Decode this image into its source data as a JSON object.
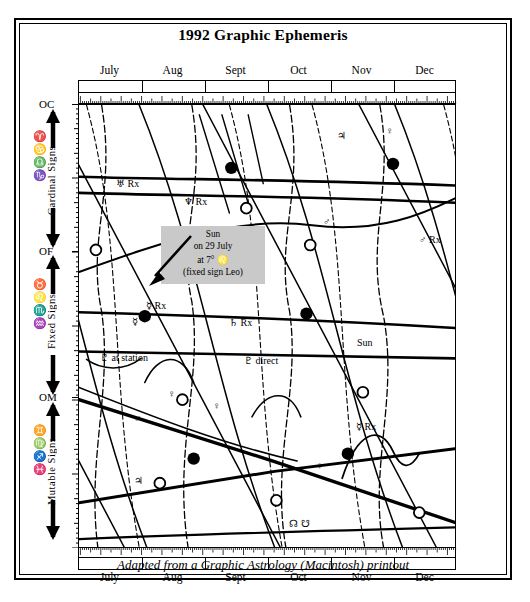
{
  "title": "1992 Graphic Ephemeris",
  "caption": "Adapted from a Graphic Astrology (Macintosh) printout",
  "axes": {
    "months": [
      "July",
      "Aug",
      "Sept",
      "Oct",
      "Nov",
      "Dec"
    ],
    "y_markers": [
      {
        "label": "OC",
        "meaning": "0 degrees Cardinal"
      },
      {
        "label": "OF",
        "meaning": "0 degrees Fixed"
      },
      {
        "label": "OM",
        "meaning": "0 degrees Mutable"
      }
    ],
    "y_groups": [
      {
        "name": "Cardinal Signs",
        "glyphs": "♈ ♋ ♎ ♑"
      },
      {
        "name": "Fixed Signs",
        "glyphs": "♉ ♌ ♏ ♒"
      },
      {
        "name": "Mutable Signs",
        "glyphs": "♊ ♍ ♐ ♓"
      }
    ]
  },
  "annotation": {
    "line1": "Sun",
    "line2": "on 29 July",
    "line3": "at 7° ♌",
    "line4": "(fixed sign Leo)"
  },
  "plot_labels": [
    {
      "id": "uranus-rx",
      "text": "♅ Rx"
    },
    {
      "id": "neptune-rx",
      "text": "♆ Rx"
    },
    {
      "id": "jupiter-top",
      "text": "♃"
    },
    {
      "id": "venus-top",
      "text": "♀"
    },
    {
      "id": "mars-mid",
      "text": "♂"
    },
    {
      "id": "mars-rx",
      "text": "♂ Rx"
    },
    {
      "id": "mercury-rx-1",
      "text": "☿ Rx"
    },
    {
      "id": "mercury-low-1",
      "text": "☿"
    },
    {
      "id": "saturn-rx",
      "text": "♄ Rx"
    },
    {
      "id": "pluto-station",
      "text": "♇ at station"
    },
    {
      "id": "pluto-direct",
      "text": "♇ direct"
    },
    {
      "id": "sun-open",
      "text": "Sun"
    },
    {
      "id": "mars-low",
      "text": "♂"
    },
    {
      "id": "venus-low",
      "text": "♀"
    },
    {
      "id": "venus-low-2",
      "text": "♀"
    },
    {
      "id": "mercury-rx-2",
      "text": "☿ Rx"
    },
    {
      "id": "jupiter-bottom",
      "text": "♃"
    },
    {
      "id": "lunar-nodes",
      "text": "☊ ☋"
    },
    {
      "id": "venus-right",
      "text": "♀"
    }
  ],
  "chart_data": {
    "type": "line",
    "title": "1992 Graphic Ephemeris",
    "xlabel": "",
    "ylabel": "",
    "x": [
      "July",
      "Aug",
      "Sept",
      "Oct",
      "Nov",
      "Dec"
    ],
    "xlim": [
      0,
      6
    ],
    "ylim": [
      0,
      90
    ],
    "grid": false,
    "legend": "inline-labels",
    "y_axis_note": "Degrees within mode; 0C at top, 0F at middle, 0M at lower; 3 x 30-degree bands",
    "series": [
      {
        "name": "Uranus Rx",
        "glyph": "♅",
        "values": [
          17,
          17.5,
          18,
          18.5,
          19,
          19.5
        ]
      },
      {
        "name": "Neptune Rx",
        "glyph": "♆",
        "values": [
          21,
          21.3,
          21.6,
          22,
          22.4,
          22.8
        ]
      },
      {
        "name": "Saturn Rx",
        "glyph": "♄",
        "values": [
          48,
          48.6,
          49.2,
          50,
          51,
          52
        ]
      },
      {
        "name": "Pluto",
        "glyph": "♇",
        "values": [
          57,
          57.2,
          57.5,
          58,
          58.4,
          58.8
        ]
      },
      {
        "name": "Jupiter",
        "glyph": "♃",
        "values": [
          72,
          75,
          78,
          81,
          84,
          87
        ]
      },
      {
        "name": "Lunar Nodes",
        "glyph": "☊",
        "values": [
          84,
          83,
          82,
          81,
          80,
          79
        ]
      },
      {
        "name": "Sun",
        "glyph": "☉",
        "values": [
          7,
          37,
          67,
          7,
          37,
          67
        ]
      },
      {
        "name": "Mars",
        "glyph": "♂",
        "values": [
          62,
          40,
          22,
          18,
          20,
          26
        ]
      },
      {
        "name": "Venus",
        "glyph": "♀",
        "values": [
          26,
          48,
          70,
          12,
          34,
          56
        ]
      },
      {
        "name": "Mercury",
        "glyph": "☿",
        "values": [
          30,
          55,
          72,
          20,
          44,
          64
        ]
      }
    ],
    "markers": {
      "new_moon": "filled-circle",
      "full_moon": "open-circle"
    }
  }
}
